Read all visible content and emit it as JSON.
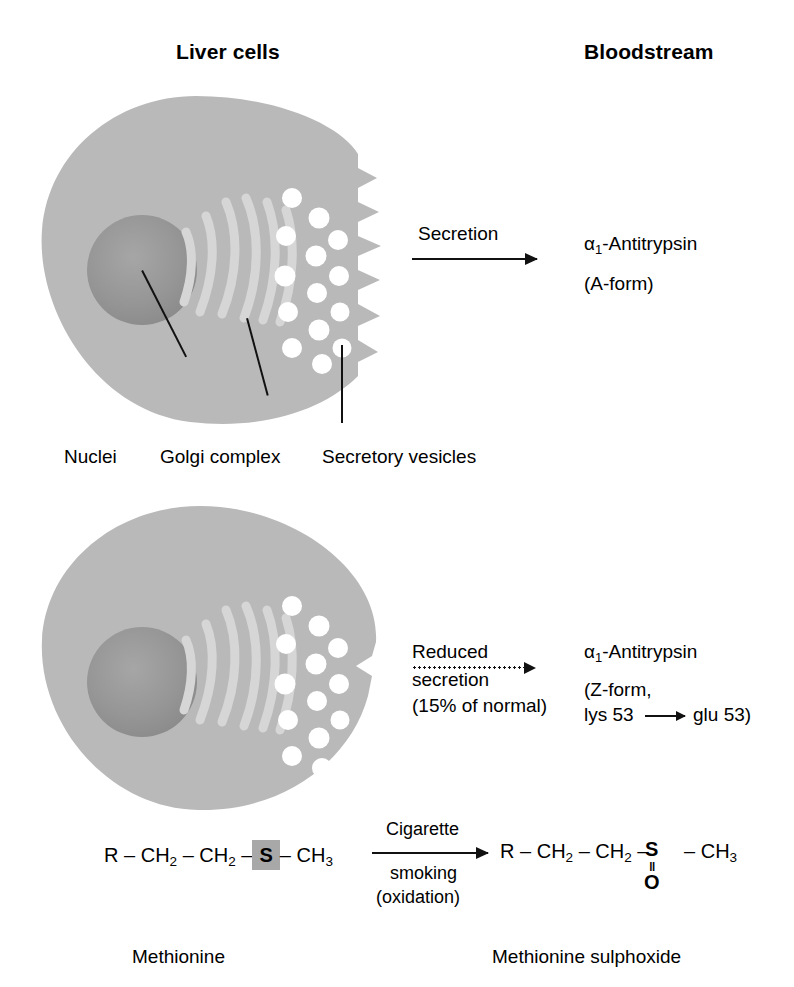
{
  "figure": {
    "headers": {
      "left": "Liver cells",
      "right": "Bloodstream"
    }
  },
  "normal_cell": {
    "labels": {
      "nuclei": "Nuclei",
      "golgi": "Golgi complex",
      "vesicles": "Secretory vesicles"
    },
    "arrow_label": "Secretion",
    "product_line1_alpha": "α",
    "product_line1_sub": "1",
    "product_line1_rest": "-Antitrypsin",
    "product_line2": "(A-form)"
  },
  "deficient_cell": {
    "arrow_label_line1": "Reduced",
    "arrow_label_line2": "secretion",
    "arrow_label_line3": "(15% of normal)",
    "product_line1_alpha": "α",
    "product_line1_sub": "1",
    "product_line1_rest": "-Antitrypsin",
    "product_line2": "(Z-form,",
    "product_line3_from": "lys 53",
    "product_line3_to": "glu 53)"
  },
  "reaction": {
    "reactant": {
      "r": "R",
      "ch2_a": "CH",
      "ch2_a_sub": "2",
      "ch2_b": "CH",
      "ch2_b_sub": "2",
      "s": "S",
      "ch3": "CH",
      "ch3_sub": "3",
      "dash": "–",
      "caption": "Methionine"
    },
    "product": {
      "r": "R",
      "ch2_a": "CH",
      "ch2_a_sub": "2",
      "ch2_b": "CH",
      "ch2_b_sub": "2",
      "s": "S",
      "double_bond": "‖",
      "o": "O",
      "ch3": "CH",
      "ch3_sub": "3",
      "dash": "–",
      "caption": "Methionine sulphoxide"
    },
    "condition_above": "Cigarette",
    "condition_below1": "smoking",
    "condition_below2": "(oxidation)"
  },
  "colors": {
    "cytoplasm": "#b9b9b9",
    "nucleus": "#939393",
    "golgi": "#d6d6d6",
    "vesicle": "#ffffff",
    "atom_box": "#a8a8a8",
    "ink": "#111111"
  }
}
